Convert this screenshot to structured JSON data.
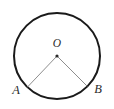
{
  "figure": {
    "kind": "geometry-diagram",
    "background_color": "#ffffff",
    "width": 114,
    "height": 109,
    "circle": {
      "name": "circle-outline",
      "center_x": 57,
      "center_y": 56,
      "radius": 43,
      "stroke_color": "#1a1a1a",
      "stroke_width": 2,
      "fill": "none"
    },
    "center_point": {
      "name": "center-point-o",
      "x": 57,
      "y": 56,
      "radius": 1.6,
      "color": "#2b2b2b"
    },
    "radii": [
      {
        "name": "radius-oa",
        "x1": 57,
        "y1": 56,
        "x2": 27.5,
        "y2": 87,
        "stroke_color": "#8e8e8e",
        "stroke_width": 1
      },
      {
        "name": "radius-ob",
        "x1": 57,
        "y1": 56,
        "x2": 87,
        "y2": 86,
        "stroke_color": "#8e8e8e",
        "stroke_width": 1
      }
    ],
    "labels": [
      {
        "id": "O",
        "text": "O",
        "x": 57,
        "y": 47,
        "anchor": "middle"
      },
      {
        "id": "A",
        "text": "A",
        "x": 16,
        "y": 94,
        "anchor": "middle"
      },
      {
        "id": "B",
        "text": "B",
        "x": 98,
        "y": 93,
        "anchor": "middle"
      }
    ]
  }
}
